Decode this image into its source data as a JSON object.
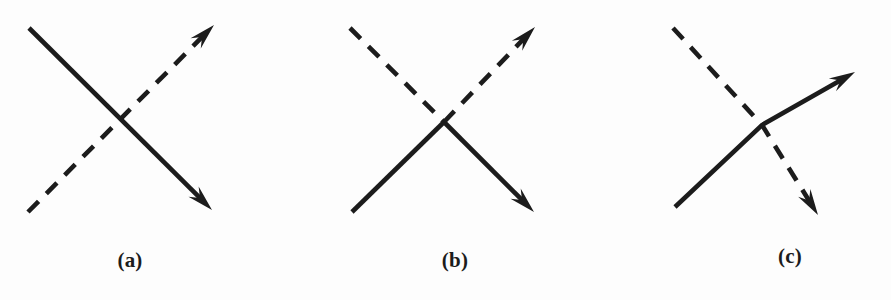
{
  "figure": {
    "caption_style": "serif-bold-parenthesized",
    "background_color": "#fdfdfd",
    "ink_color": "#1c1c1c",
    "width": 891,
    "height": 300
  },
  "chart_data": {
    "type": "diagram",
    "title": "",
    "subtitle": "",
    "xlabel": "",
    "ylabel": "",
    "background": "#fdfdfd",
    "stroke_color": "#1c1c1c",
    "stroke_width": 4.6,
    "dash_pattern": "15 11",
    "panels": [
      {
        "id": "a",
        "label": "(a)",
        "label_x": 130,
        "label_y": 262,
        "crossing_point": [
          123,
          125
        ],
        "strokes": [
          {
            "name": "solid-line-downright",
            "style": "solid",
            "points": [
              [
                29,
                28
              ],
              [
                212,
                210
              ]
            ],
            "arrow_at": "end",
            "arrow_tip": [
              212,
              210
            ],
            "direction": "down-right"
          },
          {
            "name": "dashed-line-upright",
            "style": "dashed",
            "points": [
              [
                28,
                212
              ],
              [
                214,
                25
              ]
            ],
            "arrow_at": "end",
            "arrow_tip": [
              214,
              25
            ],
            "direction": "up-right"
          }
        ]
      },
      {
        "id": "b",
        "label": "(b)",
        "label_x": 455,
        "label_y": 262,
        "crossing_point": [
          444,
          122
        ],
        "strokes": [
          {
            "name": "dashed-incoming-upper-left",
            "style": "dashed",
            "points": [
              [
                350,
                28
              ],
              [
                444,
                122
              ]
            ],
            "arrow_at": "none",
            "direction": "down-right"
          },
          {
            "name": "solid-outgoing-lower-right",
            "style": "solid",
            "points": [
              [
                444,
                122
              ],
              [
                534,
                212
              ]
            ],
            "arrow_at": "end",
            "arrow_tip": [
              534,
              212
            ],
            "direction": "down-right"
          },
          {
            "name": "solid-incoming-lower-left",
            "style": "solid",
            "points": [
              [
                352,
                212
              ],
              [
                444,
                122
              ]
            ],
            "arrow_at": "none",
            "direction": "up-right"
          },
          {
            "name": "dashed-outgoing-upper-right",
            "style": "dashed",
            "points": [
              [
                444,
                122
              ],
              [
                535,
                27
              ]
            ],
            "arrow_at": "end",
            "arrow_tip": [
              535,
              27
            ],
            "direction": "up-right"
          }
        ]
      },
      {
        "id": "c",
        "label": "(c)",
        "label_x": 790,
        "label_y": 258,
        "crossing_point": [
          762,
          125
        ],
        "strokes": [
          {
            "name": "solid-bent-line-upright",
            "style": "solid",
            "points": [
              [
                675,
                207
              ],
              [
                762,
                125
              ],
              [
                855,
                72
              ]
            ],
            "arrow_at": "end",
            "arrow_tip": [
              855,
              72
            ],
            "direction": "up-right"
          },
          {
            "name": "dashed-bent-line-downright",
            "style": "dashed",
            "points": [
              [
                673,
                28
              ],
              [
                762,
                125
              ],
              [
                818,
                215
              ]
            ],
            "arrow_at": "end",
            "arrow_tip": [
              818,
              215
            ],
            "direction": "down-right"
          }
        ]
      }
    ]
  },
  "labels": {
    "panel_a": "(a)",
    "panel_b": "(b)",
    "panel_c": "(c)"
  }
}
